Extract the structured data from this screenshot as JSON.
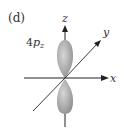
{
  "figure": {
    "panel_label": "(d)",
    "orbital_label": {
      "prefix": "4",
      "letter": "p",
      "subscript": "z"
    },
    "axes": {
      "x": "x",
      "y": "y",
      "z": "z"
    },
    "colors": {
      "lobe": "#a8a8a8",
      "lobe_highlight": "#d4d4d4",
      "axis": "#222222"
    }
  }
}
